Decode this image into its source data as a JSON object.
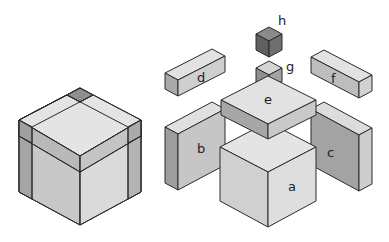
{
  "diagram": {
    "colors": {
      "light": "#e6e6e6",
      "mid": "#c8c8c8",
      "dark": "#a9a9a9",
      "darker": "#8c8c8c",
      "darkest": "#7a7a7a",
      "stroke": "#2a2a2a"
    },
    "labels": {
      "a": "a",
      "b": "b",
      "c": "c",
      "d": "d",
      "e": "e",
      "f": "f",
      "g": "g",
      "h": "h"
    }
  }
}
